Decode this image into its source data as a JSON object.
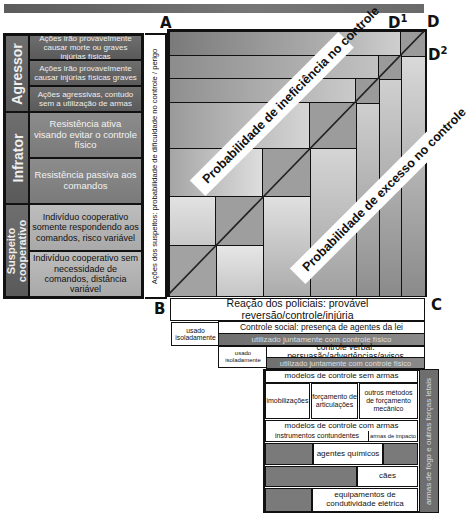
{
  "points": {
    "A": "A",
    "B": "B",
    "C": "C",
    "D": "D",
    "D1_base": "D",
    "D1_sup": "1",
    "D2_base": "D",
    "D2_sup": "2"
  },
  "left_panel": {
    "categories": [
      {
        "label": "Agressor"
      },
      {
        "label": "Infrator"
      },
      {
        "label": "Suspeito cooperativo"
      }
    ],
    "cells": [
      {
        "text": "Ações irão provavelmente causar morte ou graves injúrias físicas"
      },
      {
        "text": "Ações irão provavelmente causar injúrias físicas graves"
      },
      {
        "text": "Ações agressivas, contudo sem a utilização de armas"
      },
      {
        "text": "Resistência ativa visando evitar o controle físico"
      },
      {
        "text": "Resistência passiva aos comandos"
      },
      {
        "text": "Indivíduo cooperativo somente respondendo aos comandos, risco variável"
      },
      {
        "text": "Indivíduo cooperativo sem necessidade de comandos, distância variável"
      }
    ],
    "y_axis_label": "Ações dos suspeitos: probabilidade de dificuldade no controle / perigo"
  },
  "grid": {
    "banner_upper": "Probabilidade de ineficiência no controle",
    "banner_lower": "Probabilidade de excesso no controle"
  },
  "bottom": {
    "reaction": "Reação dos policiais: provável reversão/controle/injúria",
    "social_control": "Controle social: presença de agentes da lei",
    "used_alone_1": "usado isoladamente",
    "used_with_physical_1": "utilizado juntamente com controle físico",
    "verbal_control": "controle verbal: persuasão/advertências/avisos",
    "used_alone_2": "usado isoladamente",
    "used_with_physical_2": "utilizado juntamente com controle físico",
    "unarmed_models": "modelos de controle sem armas",
    "immobilizations": "imobilizações",
    "joint_forcing": "forçamento de articulações",
    "other_methods": "outros métodos de forçamento mecânico",
    "armed_models": "modelos de controle com armas",
    "blunt_instruments": "instrumentos contundentes",
    "impact_weapons": "armas de impacto",
    "chemical_agents": "agentes químicos",
    "dogs": "cães",
    "electrical": "equipamentos de condutividade elétrica",
    "firearms": "armas de fogo e outras forças letais"
  }
}
